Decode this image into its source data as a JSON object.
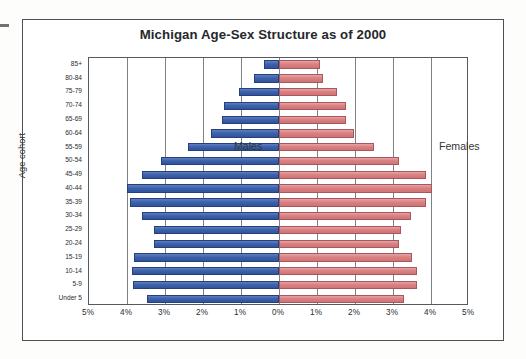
{
  "chart_data": {
    "type": "bar",
    "subtype": "population-pyramid",
    "title": "Michigan Age-Sex Structure as of 2000",
    "xlabel": "",
    "ylabel": "Age cohort",
    "grid": true,
    "legend_position": "in-plot",
    "xlim": [
      -5,
      5
    ],
    "xtick_values": [
      -5,
      -4,
      -3,
      -2,
      -1,
      0,
      1,
      2,
      3,
      4,
      5
    ],
    "xtick_labels": [
      "5%",
      "4%",
      "3%",
      "2%",
      "1%",
      "0%",
      "1%",
      "2%",
      "3%",
      "4%",
      "5%"
    ],
    "categories": [
      "85+",
      "80-84",
      "75-79",
      "70-74",
      "65-69",
      "60-64",
      "55-59",
      "50-54",
      "45-49",
      "40-44",
      "35-39",
      "30-34",
      "25-29",
      "20-24",
      "15-19",
      "10-14",
      "5-9",
      "Under 5"
    ],
    "series": [
      {
        "name": "Males",
        "color": "#3d62ab",
        "direction": "left",
        "values": [
          0.4,
          0.66,
          1.05,
          1.45,
          1.5,
          1.79,
          2.39,
          3.1,
          3.6,
          4.0,
          3.92,
          3.6,
          3.29,
          3.29,
          3.82,
          3.87,
          3.85,
          3.47
        ]
      },
      {
        "name": "Females",
        "color": "#d07375",
        "direction": "right",
        "values": [
          1.08,
          1.15,
          1.53,
          1.76,
          1.76,
          1.97,
          2.5,
          3.16,
          3.87,
          4.03,
          3.87,
          3.47,
          3.21,
          3.16,
          3.5,
          3.63,
          3.63,
          3.29
        ]
      }
    ],
    "annotations": [
      {
        "text": "Males",
        "position": "left-upper"
      },
      {
        "text": "Females",
        "position": "right-upper"
      }
    ]
  },
  "colors": {
    "male_fill": "#3d62ab",
    "male_border": "#25407d",
    "female_fill": "#d07375",
    "female_border": "#a8585c",
    "grid": "#7d8287",
    "frame": "#4d5055",
    "text": "#2a2d31"
  }
}
